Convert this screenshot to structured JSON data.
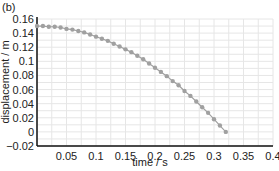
{
  "chart_data": {
    "type": "scatter",
    "panel_label": "(b)",
    "title": "",
    "xlabel": "time / s",
    "ylabel": "displacement / m",
    "xlim": [
      0,
      0.4
    ],
    "ylim": [
      -0.02,
      0.16
    ],
    "x_ticks": [
      "0.05",
      "0.1",
      "0.15",
      "0.2",
      "0.25",
      "0.3",
      "0.35",
      "0.4"
    ],
    "y_ticks": [
      "0.16",
      "0.14",
      "0.12",
      "0.1",
      "0.08",
      "0.06",
      "0.04",
      "0.02",
      "0",
      "-0.02"
    ],
    "grid": true,
    "legend": "none",
    "marker_color": "#a0a0a0",
    "series": [
      {
        "name": "displacement",
        "x": [
          0.0,
          0.01,
          0.02,
          0.03,
          0.04,
          0.05,
          0.06,
          0.07,
          0.08,
          0.09,
          0.1,
          0.11,
          0.12,
          0.13,
          0.14,
          0.15,
          0.16,
          0.17,
          0.18,
          0.19,
          0.2,
          0.21,
          0.22,
          0.23,
          0.24,
          0.25,
          0.26,
          0.27,
          0.28,
          0.29,
          0.3,
          0.31,
          0.32
        ],
        "values": [
          0.15,
          0.15,
          0.149,
          0.149,
          0.148,
          0.146,
          0.145,
          0.143,
          0.141,
          0.138,
          0.135,
          0.132,
          0.129,
          0.125,
          0.121,
          0.117,
          0.113,
          0.108,
          0.103,
          0.097,
          0.091,
          0.085,
          0.079,
          0.072,
          0.066,
          0.058,
          0.051,
          0.043,
          0.035,
          0.027,
          0.018,
          0.009,
          0.0
        ]
      }
    ]
  }
}
